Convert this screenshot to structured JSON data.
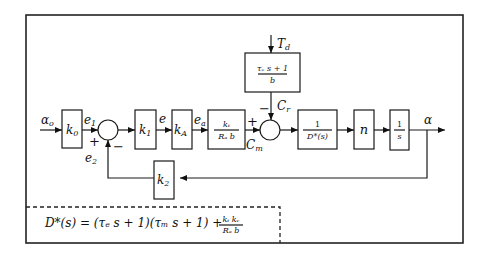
{
  "diagram": {
    "title": "",
    "signals": {
      "input": "α",
      "input_sub": "o",
      "e1": "e",
      "e1_sub": "1",
      "e2": "e",
      "e2_sub": "2",
      "e": "e",
      "ea": "e",
      "ea_sub": "a",
      "cm": "C",
      "cm_sub": "m",
      "cr": "C",
      "cr_sub": "r",
      "td": "T",
      "td_sub": "d",
      "output": "α"
    },
    "blocks": {
      "k0": {
        "main": "k",
        "sub": "0"
      },
      "k1": {
        "main": "k",
        "sub": "1"
      },
      "kA": {
        "main": "k",
        "sub": "A"
      },
      "k2": {
        "main": "k",
        "sub": "2"
      },
      "motor_gain": {
        "num": "kₜ",
        "den": "Rₐ b"
      },
      "disturbance": {
        "num": "τₑ s + 1",
        "den": "b"
      },
      "plant": {
        "num": "1",
        "den": "D*(s)"
      },
      "gear": {
        "main": "n"
      },
      "integrator": {
        "num": "1",
        "den": "s"
      }
    },
    "summing_junction_1": {
      "plus": "+",
      "minus": "−"
    },
    "summing_junction_2": {
      "plus": "+",
      "minus": "−"
    },
    "equation": {
      "lhs": "D*(s) = (τₑ s + 1)(τₘ s + 1) + ",
      "frac_num": "kₜ kᵥ",
      "frac_den": "Rₐ b"
    }
  }
}
